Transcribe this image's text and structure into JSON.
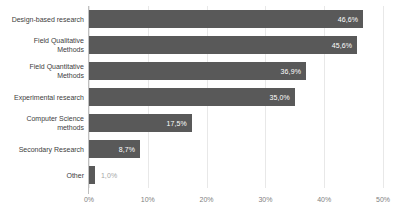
{
  "chart_data": {
    "type": "bar",
    "orientation": "horizontal",
    "title": "",
    "xlabel": "",
    "ylabel": "",
    "xlim": [
      0,
      50
    ],
    "grid": true,
    "legend": false,
    "decimal_separator": ",",
    "categories": [
      "Design-based research",
      "Field Qualitative\nMethods",
      "Field Quantitative\nMethods",
      "Experimental research",
      "Computer Science\nmethods",
      "Secondary Research",
      "Other"
    ],
    "values": [
      46.6,
      45.6,
      36.9,
      35.0,
      17.5,
      8.7,
      1.0
    ],
    "value_labels": [
      "46,6%",
      "45,6%",
      "36,9%",
      "35,0%",
      "17,5%",
      "8,7%",
      "1,0%"
    ],
    "label_placement": [
      "inside",
      "inside",
      "inside",
      "inside",
      "inside",
      "inside",
      "outside"
    ],
    "xticks": [
      0,
      10,
      20,
      30,
      40,
      50
    ],
    "xtick_labels": [
      "0%",
      "10%",
      "20%",
      "30%",
      "40%",
      "50%"
    ],
    "colors": {
      "bar": "#595959",
      "gridline": "#e8e8e8",
      "axis": "#bfbfbf",
      "category_label": "#404040",
      "tick_label": "#808080",
      "value_label_inside": "#ffffff",
      "value_label_outside": "#a6a6a6",
      "background": "#ffffff"
    }
  }
}
